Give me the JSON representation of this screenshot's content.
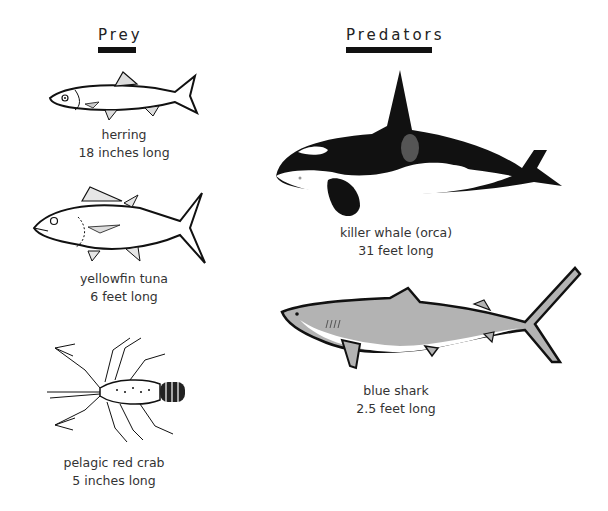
{
  "headings": {
    "prey": "Prey",
    "predators": "Predators"
  },
  "prey": [
    {
      "name": "herring",
      "size": "18 inches long",
      "icon": "herring-illustration"
    },
    {
      "name": "yellowfin tuna",
      "size": "6 feet long",
      "icon": "tuna-illustration"
    },
    {
      "name": "pelagic red crab",
      "size": "5 inches long",
      "icon": "crab-illustration"
    }
  ],
  "predators": [
    {
      "name": "killer whale (orca)",
      "size": "31 feet long",
      "icon": "orca-illustration"
    },
    {
      "name": "blue shark",
      "size": "2.5 feet long",
      "icon": "shark-illustration"
    }
  ],
  "colors": {
    "ink": "#111111",
    "shark_fill": "#b3b3b3",
    "orca_saddle": "#555555",
    "text": "#333333"
  }
}
